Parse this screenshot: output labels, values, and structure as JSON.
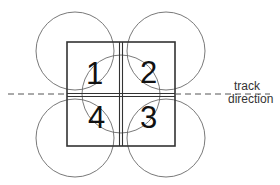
{
  "diagram": {
    "quadrants": [
      {
        "id": "q1",
        "label": "1"
      },
      {
        "id": "q2",
        "label": "2"
      },
      {
        "id": "q3",
        "label": "3"
      },
      {
        "id": "q4",
        "label": "4"
      }
    ],
    "track_label": {
      "line1": "track",
      "line2": "direction"
    },
    "colors": {
      "stroke": "#333333",
      "circle": "#6a6a6a",
      "text": "#111111",
      "background": "#ffffff"
    }
  }
}
